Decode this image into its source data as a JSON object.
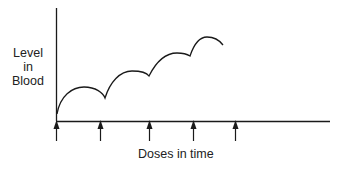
{
  "diagram": {
    "y_axis_label": [
      "Level",
      "in",
      "Blood"
    ],
    "x_axis_label": "Doses in time",
    "dose_arrows_count": 5
  },
  "colors": {
    "line": "#1a1a1a",
    "background": "#ffffff"
  }
}
